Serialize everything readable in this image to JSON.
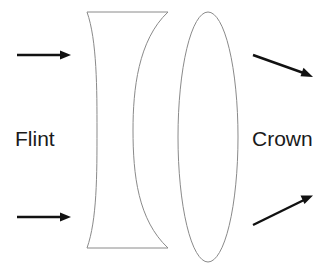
{
  "diagram": {
    "labels": {
      "left": "Flint",
      "right": "Crown"
    },
    "elements": {
      "flint_lens": "concave lens",
      "crown_lens": "convex lens"
    },
    "rays": [
      {
        "name": "incoming-top",
        "direction": "right"
      },
      {
        "name": "incoming-bottom",
        "direction": "right"
      },
      {
        "name": "outgoing-top",
        "direction": "down-right"
      },
      {
        "name": "outgoing-bottom",
        "direction": "up-right"
      }
    ],
    "colors": {
      "lens_stroke": "#8a8a8a",
      "ray": "#111111",
      "text": "#1a1a1a",
      "background": "#ffffff"
    }
  }
}
